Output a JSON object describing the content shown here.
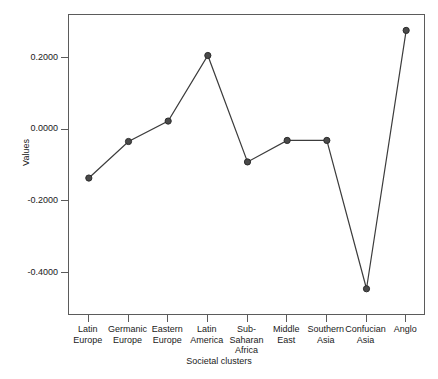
{
  "chart_data": {
    "type": "line",
    "title": "",
    "xlabel": "Societal clusters",
    "ylabel": "Values",
    "grid": false,
    "legend": "none",
    "marker": "filled-circle",
    "line_color": "#3c3c3c",
    "marker_color": "#4a4a4a",
    "frame_color": "#5b5b5b",
    "ylim": [
      -0.52,
      0.32
    ],
    "y_ticks": [
      0.2,
      0.0,
      -0.2,
      -0.4
    ],
    "y_tick_labels": [
      "0.2000",
      "0.0000",
      "-0.2000",
      "-0.4000"
    ],
    "categories": [
      "Latin\nEurope",
      "Germanic\nEurope",
      "Eastern\nEurope",
      "Latin\nAmerica",
      "Sub-\nSaharan\nAfrica",
      "Middle\nEast",
      "Southern\nAsia",
      "Confucian\nAsia",
      "Anglo"
    ],
    "categories_flat": [
      "Latin Europe",
      "Germanic Europe",
      "Eastern Europe",
      "Latin America",
      "Sub-Saharan Africa",
      "Middle East",
      "Southern Asia",
      "Confucian Asia",
      "Anglo"
    ],
    "values": [
      -0.135,
      -0.033,
      0.024,
      0.207,
      -0.09,
      -0.03,
      -0.03,
      -0.444,
      0.277
    ]
  }
}
